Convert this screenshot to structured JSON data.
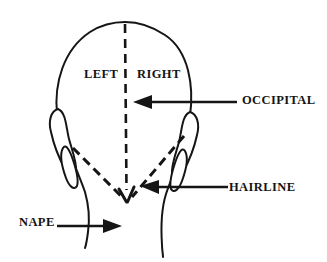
{
  "diagram": {
    "labels": {
      "left": "LEFT",
      "right": "RIGHT",
      "occipital": "OCCIPITAL",
      "hairline": "HAIRLINE",
      "nape": "NAPE"
    },
    "colors": {
      "line": "#151515",
      "background": "#ffffff"
    }
  }
}
